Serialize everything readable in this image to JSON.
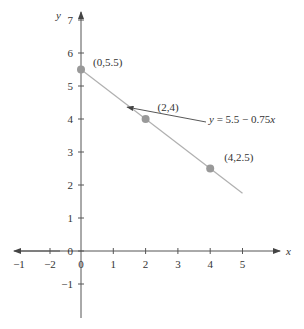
{
  "chart_data": {
    "type": "line",
    "title": "",
    "xlabel": "x",
    "ylabel": "y",
    "xlim": [
      -1,
      5.7
    ],
    "ylim": [
      -2,
      7
    ],
    "grid": false,
    "x_ticks": [
      0,
      1,
      2,
      3,
      4,
      5
    ],
    "x_tick_labels_left": [
      "-1",
      "-2"
    ],
    "y_ticks": [
      -1,
      0,
      1,
      2,
      3,
      4,
      5,
      6,
      7
    ],
    "series": [
      {
        "name": "y = 5.5 - 0.75x",
        "x": [
          0,
          5
        ],
        "y": [
          5.5,
          1.75
        ],
        "color": "#b0b0b0"
      }
    ],
    "points": [
      {
        "x": 0,
        "y": 5.5,
        "label": "(0,5.5)"
      },
      {
        "x": 2,
        "y": 4,
        "label": "(2,4)"
      },
      {
        "x": 4,
        "y": 2.5,
        "label": "(4,2.5)"
      }
    ],
    "annotations": [
      {
        "text": "y = 5.5 − 0.75x",
        "arrow_to": [
          1.4,
          4.45
        ]
      }
    ],
    "point_color": "#999999",
    "axis_color": "#555555"
  }
}
